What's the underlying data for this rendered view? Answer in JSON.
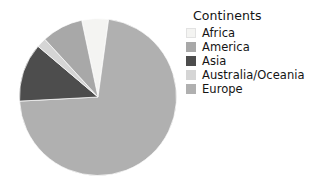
{
  "chart_data": {
    "type": "pie",
    "title": "",
    "legend_title": "Continents",
    "legend_position": "right",
    "categories": [
      "Africa",
      "America",
      "Asia",
      "Australia/Oceania",
      "Europe"
    ],
    "values": [
      5.5,
      8.5,
      12.0,
      2.0,
      72.0
    ],
    "units": "percent",
    "colors": [
      "#f4f4f2",
      "#a8a8a8",
      "#4d4d4d",
      "#d5d5d5",
      "#b0b0b0"
    ],
    "slice_order_clockwise": [
      "Africa",
      "Europe",
      "Asia",
      "Australia/Oceania",
      "America"
    ],
    "start_angle_deg": -12,
    "grid": false
  },
  "legend": {
    "title": "Continents",
    "items": [
      {
        "label": "Africa",
        "color": "#f4f4f2"
      },
      {
        "label": "America",
        "color": "#a8a8a8"
      },
      {
        "label": "Asia",
        "color": "#4d4d4d"
      },
      {
        "label": "Australia/Oceania",
        "color": "#d5d5d5"
      },
      {
        "label": "Europe",
        "color": "#b0b0b0"
      }
    ]
  }
}
